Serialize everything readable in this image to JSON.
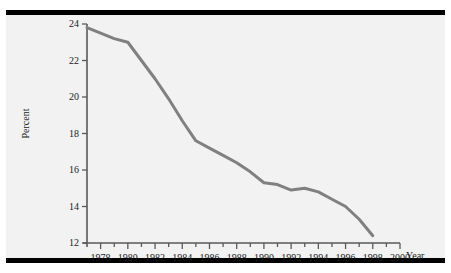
{
  "figure": {
    "background_color": "#ffffff",
    "plot_background_color": "#f2f2f2",
    "rule_color": "#000000",
    "line_color": "#808080",
    "axis_color": "#595959",
    "text_color": "#1a1a1a"
  },
  "axis_titles": {
    "y": "Percent",
    "x": "Year"
  },
  "ticks": {
    "y": [
      "12",
      "14",
      "16",
      "18",
      "20",
      "22",
      "24"
    ],
    "x": [
      "1978",
      "1980",
      "1982",
      "1984",
      "1986",
      "1988",
      "1990",
      "1992",
      "1994",
      "1996",
      "1998",
      "2000"
    ]
  },
  "chart_data": {
    "type": "line",
    "title": "",
    "xlabel": "Year",
    "ylabel": "Percent",
    "xlim": [
      1977,
      2000
    ],
    "ylim": [
      12,
      24
    ],
    "ytick_step": 2,
    "xtick_step": 2,
    "xminor_tick_step": 1,
    "grid": false,
    "legend": "none",
    "series": [
      {
        "name": "Percent",
        "x": [
          1977,
          1978,
          1979,
          1980,
          1981,
          1982,
          1983,
          1984,
          1985,
          1986,
          1987,
          1988,
          1989,
          1990,
          1991,
          1992,
          1993,
          1994,
          1995,
          1996,
          1997,
          1998
        ],
        "values": [
          23.8,
          23.5,
          23.2,
          23.0,
          22.0,
          21.0,
          19.9,
          18.7,
          17.6,
          17.2,
          16.8,
          16.4,
          15.9,
          15.3,
          15.2,
          14.9,
          15.0,
          14.8,
          14.4,
          14.0,
          13.3,
          12.4
        ]
      }
    ]
  }
}
